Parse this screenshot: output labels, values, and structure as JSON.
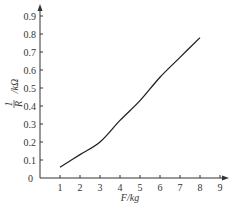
{
  "chart_data": {
    "type": "line",
    "title": "",
    "xlabel": "F/kg",
    "ylabel": "1/R /kΩ",
    "xlim": [
      0,
      9
    ],
    "ylim": [
      0,
      0.9
    ],
    "x_ticks": [
      "1",
      "2",
      "3",
      "4",
      "5",
      "6",
      "7",
      "8",
      "9"
    ],
    "y_ticks": [
      "0",
      "0.1",
      "0.2",
      "0.3",
      "0.4",
      "0.5",
      "0.6",
      "0.7",
      "0.8",
      "0.9"
    ],
    "origin_label": "0",
    "grid": false,
    "series": [
      {
        "name": "1/R vs F",
        "x": [
          1,
          2,
          3,
          4,
          5,
          6,
          7,
          8
        ],
        "values": [
          0.06,
          0.13,
          0.2,
          0.32,
          0.43,
          0.56,
          0.67,
          0.78
        ]
      }
    ]
  },
  "labels": {
    "x_axis": "F/kg",
    "y_axis_num": "1",
    "y_axis_den": "R",
    "y_axis_unit": "/kΩ"
  }
}
